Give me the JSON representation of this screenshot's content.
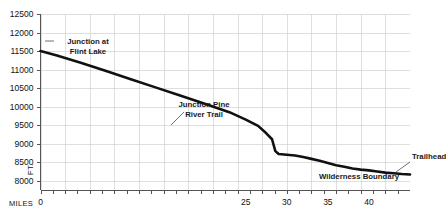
{
  "chart_data": {
    "type": "line",
    "title": "",
    "subtitle": "",
    "xlabel": "MILES",
    "ylabel": "FT.",
    "xlim": [
      0,
      45
    ],
    "ylim": [
      7750,
      12500
    ],
    "grid": true,
    "legend": "none",
    "y_ticks": [
      8000,
      8500,
      9000,
      9500,
      10000,
      10500,
      11000,
      11500,
      12000,
      12500
    ],
    "y_tick_labels": [
      "8000",
      "8500",
      "9000",
      "9500",
      "10000",
      "10500",
      "11000",
      "11500",
      "12000",
      "12500"
    ],
    "x_ticks": [
      0,
      5,
      10,
      15,
      20,
      25,
      30,
      35,
      40,
      45
    ],
    "x_tick_labels": [
      "0",
      "",
      "",
      "",
      "",
      "25",
      "30",
      "35",
      "40",
      ""
    ],
    "x_labeled_ticks": [
      {
        "value": 0,
        "label": "0"
      },
      {
        "value": 25,
        "label": "25"
      },
      {
        "value": 30,
        "label": "30"
      },
      {
        "value": 35,
        "label": "35"
      },
      {
        "value": 40,
        "label": "40"
      }
    ],
    "x_minor_tick_step": 1.5,
    "series": [
      {
        "name": "Elevation profile",
        "color": "#111111",
        "x": [
          0,
          2,
          5,
          8,
          11,
          14,
          17,
          20,
          23,
          25,
          26.5,
          27.5,
          28.2,
          28.6,
          29,
          30,
          31,
          32,
          33,
          34,
          35,
          36,
          37,
          38,
          39,
          40,
          41,
          42,
          43,
          44,
          45
        ],
        "y": [
          11500,
          11380,
          11180,
          10960,
          10740,
          10520,
          10300,
          10080,
          9850,
          9650,
          9480,
          9280,
          9120,
          8800,
          8720,
          8700,
          8680,
          8640,
          8590,
          8540,
          8480,
          8420,
          8380,
          8330,
          8300,
          8280,
          8250,
          8220,
          8200,
          8180,
          8170
        ]
      }
    ],
    "annotations": [
      {
        "name": "junction-flint-lake",
        "lines": [
          "Junction at",
          "Flint Lake"
        ],
        "x_px": 88,
        "y_px": 44,
        "align": "center",
        "leader": {
          "x1": 45,
          "y1": 41,
          "x2": 54,
          "y2": 41
        }
      },
      {
        "name": "junction-pine-river-trail",
        "lines": [
          "Junction Pine",
          "River Trail"
        ],
        "x_px": 204,
        "y_px": 107,
        "align": "center",
        "leader": {
          "x1": 184,
          "y1": 112,
          "x2": 171,
          "y2": 125
        }
      },
      {
        "name": "wilderness-boundary",
        "lines": [
          "Wilderness Boundary"
        ],
        "x_px": 359,
        "y_px": 179,
        "align": "center",
        "leader": null
      },
      {
        "name": "trailhead",
        "lines": [
          "Trailhead"
        ],
        "x_px": 412,
        "y_px": 159,
        "align": "start",
        "leader": {
          "x1": 410,
          "y1": 162,
          "x2": 396,
          "y2": 172
        }
      }
    ]
  },
  "axes": {
    "y_unit_label": "FT.",
    "x_unit_label": "MILES"
  }
}
